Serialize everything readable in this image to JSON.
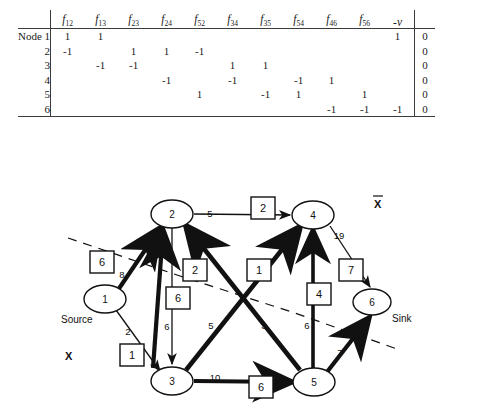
{
  "tableau": {
    "row_header_label": "Node 1",
    "columns": [
      "f12",
      "f13",
      "f23",
      "f24",
      "f52",
      "f34",
      "f35",
      "f54",
      "f46",
      "f56",
      "-v"
    ],
    "column_subscripts": [
      "12",
      "13",
      "23",
      "24",
      "52",
      "34",
      "35",
      "54",
      "46",
      "56",
      ""
    ],
    "column_bases": [
      "f",
      "f",
      "f",
      "f",
      "f",
      "f",
      "f",
      "f",
      "f",
      "f",
      "-v"
    ],
    "row_labels": [
      "Node 1",
      "2",
      "3",
      "4",
      "5",
      "6"
    ],
    "rows": [
      [
        "1",
        "1",
        "",
        "",
        "",
        "",
        "",
        "",
        "",
        "",
        "1"
      ],
      [
        "-1",
        "",
        "1",
        "1",
        "-1",
        "",
        "",
        "",
        "",
        "",
        ""
      ],
      [
        "",
        "-1",
        "-1",
        "",
        "",
        "1",
        "1",
        "",
        "",
        "",
        ""
      ],
      [
        "",
        "",
        "",
        "-1",
        "",
        "-1",
        "",
        "-1",
        "1",
        "",
        ""
      ],
      [
        "",
        "",
        "",
        "",
        "1",
        "",
        "-1",
        "1",
        "",
        "1",
        ""
      ],
      [
        "",
        "",
        "",
        "",
        "",
        "",
        "",
        "",
        "-1",
        "-1",
        "-1"
      ]
    ],
    "rhs": [
      "0",
      "0",
      "0",
      "0",
      "0",
      "0"
    ]
  },
  "graph": {
    "nodes": [
      {
        "id": "1",
        "label": "1",
        "x": 105,
        "y": 139,
        "rx": 21,
        "ry": 14
      },
      {
        "id": "2",
        "label": "2",
        "x": 172,
        "y": 54,
        "rx": 21,
        "ry": 14
      },
      {
        "id": "3",
        "label": "3",
        "x": 172,
        "y": 221,
        "rx": 21,
        "ry": 14
      },
      {
        "id": "4",
        "label": "4",
        "x": 313,
        "y": 55,
        "rx": 21,
        "ry": 14
      },
      {
        "id": "5",
        "label": "5",
        "x": 314,
        "y": 222,
        "rx": 21,
        "ry": 14
      },
      {
        "id": "6",
        "label": "6",
        "x": 372,
        "y": 142,
        "rx": 19,
        "ry": 13
      }
    ],
    "node_annotations": [
      {
        "text": "Source",
        "x": 81,
        "y": 160
      },
      {
        "text": "Sink",
        "x": 392,
        "y": 160
      }
    ],
    "set_labels": [
      {
        "text": "X",
        "x": 70,
        "y": 196
      },
      {
        "text": "X",
        "x": 378,
        "y": 44,
        "bar": true
      }
    ],
    "edges": [
      {
        "from": "1",
        "to": "2",
        "capacity": "8",
        "flow": "6",
        "bold": true
      },
      {
        "from": "1",
        "to": "3",
        "capacity": "2",
        "flow": "1",
        "bold": false
      },
      {
        "from": "2",
        "to": "4",
        "capacity": "5",
        "flow": "2",
        "bold": false
      },
      {
        "from": "2",
        "to": "3",
        "capacity": "6",
        "flow": "6",
        "bold": false
      },
      {
        "from": "3",
        "to": "2",
        "capacity": "5",
        "flow": "2",
        "bold": true
      },
      {
        "from": "3",
        "to": "5",
        "capacity": "10",
        "flow": "6",
        "bold": true
      },
      {
        "from": "3",
        "to": "4",
        "capacity": "1",
        "flow": "1",
        "bold": true
      },
      {
        "from": "5",
        "to": "2",
        "capacity": "3",
        "flow": "2",
        "bold": true
      },
      {
        "from": "5",
        "to": "4",
        "capacity": "6",
        "flow": "4",
        "bold": true
      },
      {
        "from": "4",
        "to": "6",
        "capacity": "19",
        "flow": "7",
        "bold": false
      },
      {
        "from": "5",
        "to": "6",
        "capacity": "7",
        "flow": "7",
        "bold": true
      }
    ],
    "flow_boxes": [
      {
        "value": "6",
        "x": 102,
        "y": 103
      },
      {
        "value": "1",
        "x": 132,
        "y": 196
      },
      {
        "value": "2",
        "x": 263,
        "y": 48
      },
      {
        "value": "2",
        "x": 195,
        "y": 110
      },
      {
        "value": "6",
        "x": 178,
        "y": 138
      },
      {
        "value": "1",
        "x": 259,
        "y": 110
      },
      {
        "value": "4",
        "x": 319,
        "y": 134
      },
      {
        "value": "7",
        "x": 351,
        "y": 110
      },
      {
        "value": "6",
        "x": 261,
        "y": 227
      }
    ],
    "capacity_labels": [
      {
        "value": "8",
        "x": 122,
        "y": 115
      },
      {
        "value": "2",
        "x": 128,
        "y": 172
      },
      {
        "value": "5",
        "x": 210,
        "y": 51
      },
      {
        "value": "6",
        "x": 169,
        "y": 167
      },
      {
        "value": "5",
        "x": 211,
        "y": 166
      },
      {
        "value": "3",
        "x": 264,
        "y": 166
      },
      {
        "value": "6",
        "x": 311,
        "y": 166
      },
      {
        "value": "19",
        "x": 337,
        "y": 75
      },
      {
        "value": "7",
        "x": 338,
        "y": 192
      },
      {
        "value": "10",
        "x": 215,
        "y": 218
      }
    ],
    "cut_line": {
      "name": "cut-dashed-line",
      "points": "68,78 180,116 292,152 400,190"
    }
  }
}
